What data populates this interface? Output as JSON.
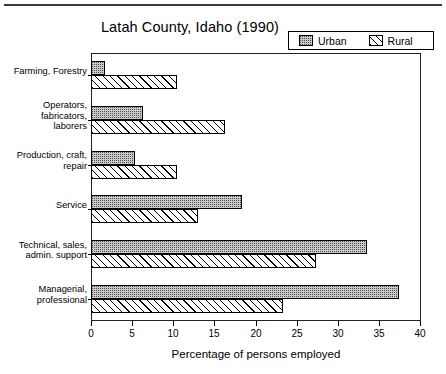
{
  "chart_data": {
    "type": "bar",
    "orientation": "horizontal",
    "title": "Latah County, Idaho (1990)",
    "xlabel": "Percentage of persons employed",
    "ylabel": "",
    "xlim": [
      0,
      40
    ],
    "xticks": [
      0,
      5,
      10,
      15,
      20,
      25,
      30,
      35,
      40
    ],
    "grid": false,
    "legend_position": "top-right",
    "categories": [
      "Farming, Forestry",
      "Operators,\nfabricators,\nlaborers",
      "Production, craft,\nrepair",
      "Service",
      "Technical, sales,\nadmin. support",
      "Managerial,\nprofessional"
    ],
    "series": [
      {
        "name": "Urban",
        "fill": "stipple-gray",
        "color": "#c9c9c9",
        "values": [
          1.7,
          6.3,
          5.3,
          18.3,
          33.5,
          37.5
        ]
      },
      {
        "name": "Rural",
        "fill": "diagonal-hatch",
        "color": "#ffffff",
        "values": [
          10.5,
          16.3,
          10.5,
          13.0,
          27.3,
          23.3
        ]
      }
    ]
  },
  "legend": {
    "urban_label": "Urban",
    "rural_label": "Rural"
  }
}
